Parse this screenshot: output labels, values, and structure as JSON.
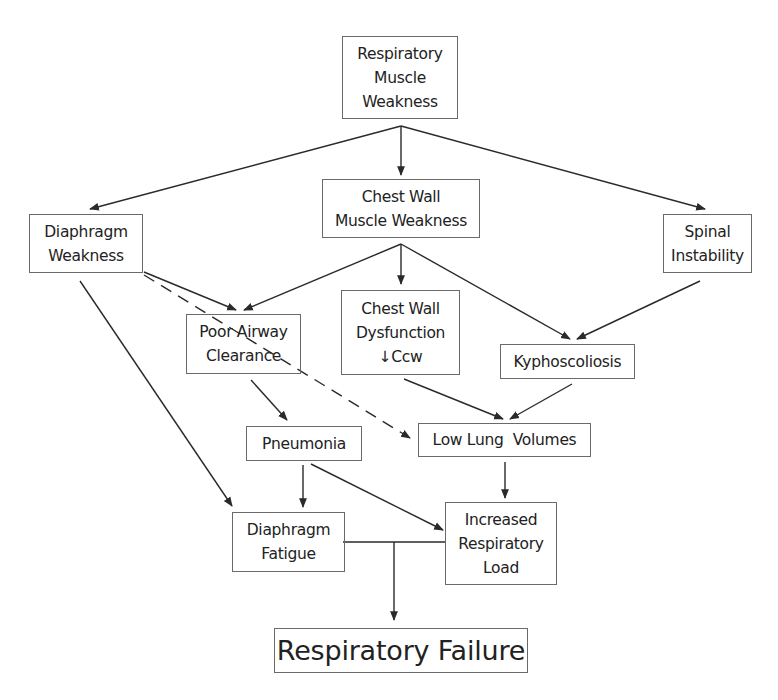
{
  "diagram": {
    "nodes": {
      "rmw": {
        "lines": [
          "Respiratory",
          "Muscle",
          "Weakness"
        ]
      },
      "cwmw": {
        "lines": [
          "Chest Wall",
          "Muscle Weakness"
        ]
      },
      "dw": {
        "lines": [
          "Diaphragm",
          "Weakness"
        ]
      },
      "si": {
        "lines": [
          "Spinal",
          "Instability"
        ]
      },
      "pac": {
        "lines": [
          "Poor Airway",
          "Clearance"
        ]
      },
      "cwd": {
        "lines": [
          "Chest Wall",
          "Dysfunction",
          "↓Ccw"
        ]
      },
      "ky": {
        "lines": [
          "Kyphoscoliosis"
        ]
      },
      "pn": {
        "lines": [
          "Pneumonia"
        ]
      },
      "llv": {
        "lines": [
          "Low Lung  Volumes"
        ]
      },
      "df": {
        "lines": [
          "Diaphragm",
          "Fatigue"
        ]
      },
      "irl": {
        "lines": [
          "Increased",
          "Respiratory",
          "Load"
        ]
      },
      "rf": {
        "lines": [
          "Respiratory Failure"
        ]
      }
    },
    "edges": [
      {
        "from": "Respiratory Muscle Weakness",
        "to": "Diaphragm Weakness",
        "style": "solid"
      },
      {
        "from": "Respiratory Muscle Weakness",
        "to": "Chest Wall Muscle Weakness",
        "style": "solid"
      },
      {
        "from": "Respiratory Muscle Weakness",
        "to": "Spinal Instability",
        "style": "solid"
      },
      {
        "from": "Chest Wall Muscle Weakness",
        "to": "Poor Airway Clearance",
        "style": "solid"
      },
      {
        "from": "Chest Wall Muscle Weakness",
        "to": "Chest Wall Dysfunction",
        "style": "solid"
      },
      {
        "from": "Chest Wall Muscle Weakness",
        "to": "Kyphoscoliosis",
        "style": "solid"
      },
      {
        "from": "Diaphragm Weakness",
        "to": "Poor Airway Clearance",
        "style": "solid"
      },
      {
        "from": "Diaphragm Weakness",
        "to": "Low Lung Volumes",
        "style": "dashed"
      },
      {
        "from": "Diaphragm Weakness",
        "to": "Diaphragm Fatigue",
        "style": "solid"
      },
      {
        "from": "Spinal Instability",
        "to": "Kyphoscoliosis",
        "style": "solid"
      },
      {
        "from": "Poor Airway Clearance",
        "to": "Pneumonia",
        "style": "solid"
      },
      {
        "from": "Chest Wall Dysfunction",
        "to": "Low Lung Volumes",
        "style": "solid"
      },
      {
        "from": "Kyphoscoliosis",
        "to": "Low Lung Volumes",
        "style": "solid"
      },
      {
        "from": "Pneumonia",
        "to": "Diaphragm Fatigue",
        "style": "solid"
      },
      {
        "from": "Pneumonia",
        "to": "Increased Respiratory Load",
        "style": "solid"
      },
      {
        "from": "Low Lung Volumes",
        "to": "Increased Respiratory Load",
        "style": "solid"
      },
      {
        "from": "Diaphragm Fatigue + Increased Respiratory Load",
        "to": "Respiratory Failure",
        "style": "solid"
      }
    ],
    "colors": {
      "line": "#2a2a2a",
      "border": "#6a6a6a",
      "text": "#222222",
      "background": "#ffffff"
    }
  }
}
